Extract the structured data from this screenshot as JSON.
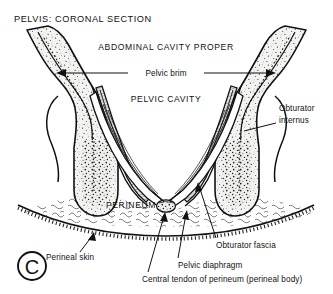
{
  "figure": {
    "title": "PELVIS:  CORONAL SECTION",
    "panel_letter": "C",
    "regions": [
      {
        "id": "abdominal",
        "label": "ABDOMINAL CAVITY PROPER"
      },
      {
        "id": "pelvic",
        "label": "PELVIC CAVITY"
      },
      {
        "id": "perineum",
        "label": "PERINEUM"
      }
    ],
    "measure_labels": [
      {
        "id": "pelvic-brim",
        "label": "Pelvic brim",
        "arrow": "double-headed"
      }
    ],
    "leader_labels": [
      {
        "id": "obturator-internus",
        "line1": "Obturator",
        "line2": "internus"
      },
      {
        "id": "obturator-fascia",
        "label": "Obturator fascia"
      },
      {
        "id": "pelvic-diaphragm",
        "label": "Pelvic diaphragm"
      },
      {
        "id": "central-tendon",
        "label": "Central tendon of perineum (perineal body)"
      },
      {
        "id": "perineal-skin",
        "label": "Perineal skin"
      }
    ],
    "colors": {
      "ink": "#111111",
      "background": "#ffffff",
      "bone_fill": "#f2f2f0",
      "muscle_fill": "#e6e6e4"
    }
  }
}
